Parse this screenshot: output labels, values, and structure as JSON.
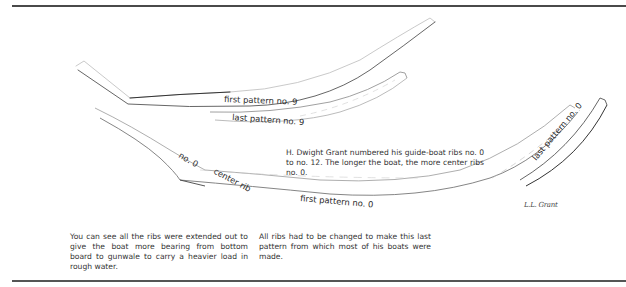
{
  "figure": {
    "labels": {
      "first_pattern_9": "first pattern no. 9",
      "last_pattern_9": "last pattern no. 9",
      "no_0": "no. 0",
      "center_rib": "center rib",
      "first_pattern_0": "first pattern no. 0",
      "last_pattern_0": "last pattern no. 0"
    },
    "signature": "L.L. Grant",
    "colors": {
      "ink": "#2a2a2a",
      "faint_line": "#bdbdbd",
      "rule": "#4a4a4a"
    }
  },
  "captions": {
    "note": "H. Dwight Grant numbered his guide-boat ribs no. 0 to no. 12. The longer the boat, the more center ribs no. 0.",
    "left": "You can see all the ribs were extended out to give the boat more bearing from bottom board to gunwale to carry a heavier load in rough water.",
    "right": "All ribs had to be changed to make this last pattern from which most of his boats were made."
  }
}
